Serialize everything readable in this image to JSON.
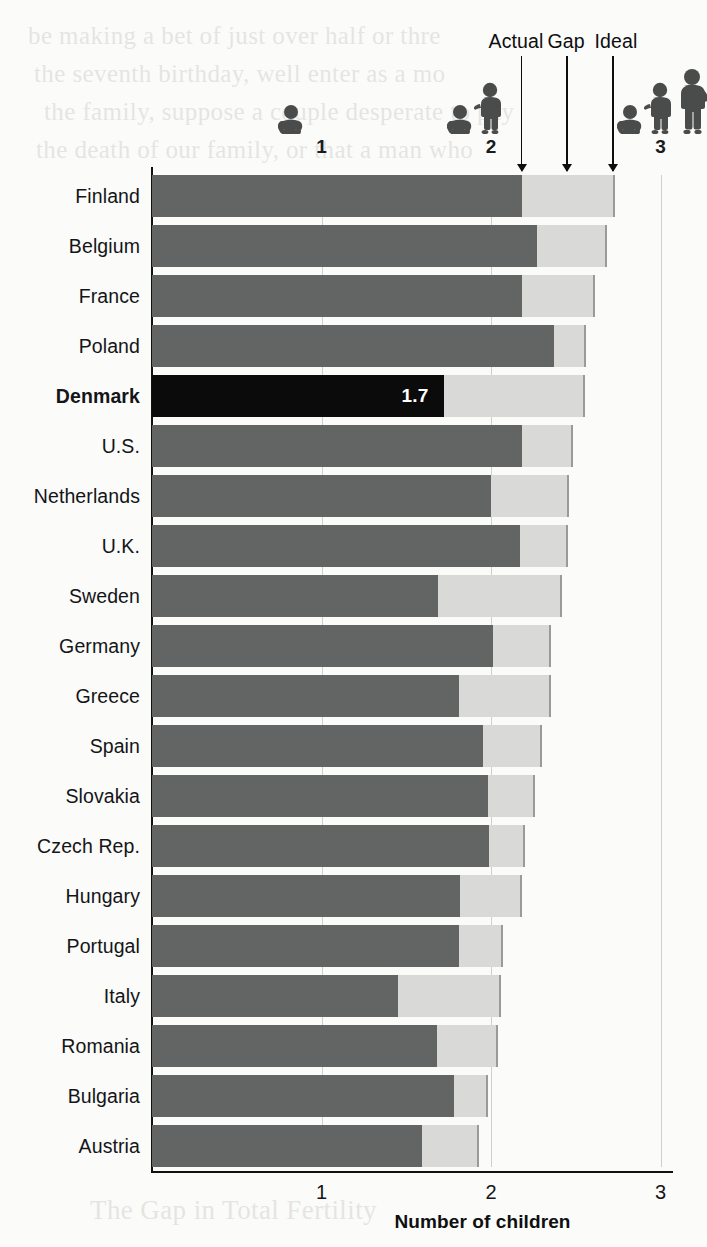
{
  "background_bleed": {
    "lines": [
      "be making a bet of just over half or thre",
      "the seventh birthday, well enter as a mo",
      "the family, suppose a couple desperate to pay",
      "the death of our family, or that a man who"
    ],
    "bottom_line": "The Gap in Total Fertility"
  },
  "legend": {
    "actual": "Actual",
    "gap": "Gap",
    "ideal": "Ideal",
    "pointer_values": {
      "actual": 2.18,
      "gap": 2.45,
      "ideal": 2.72
    }
  },
  "scale_icons": [
    {
      "tick": "1",
      "value": 1,
      "figures": [
        "baby"
      ]
    },
    {
      "tick": "2",
      "value": 2,
      "figures": [
        "baby",
        "child"
      ]
    },
    {
      "tick": "3",
      "value": 3,
      "figures": [
        "baby",
        "child",
        "teen"
      ]
    }
  ],
  "colors": {
    "actual_bar": "#636565",
    "gap_bar": "#d9d9d7",
    "highlight_bar": "#0b0b0b",
    "axis": "#111111",
    "grid": "#cfcfcb",
    "page": "#fbfbf9",
    "value_label_text": "#ffffff"
  },
  "chart_data": {
    "type": "bar",
    "title": "",
    "subtype": "stacked-horizontal",
    "xlabel": "Number of children",
    "ylabel": "",
    "xlim": [
      0,
      3
    ],
    "xticks": [
      1,
      2,
      3
    ],
    "xticklabels": [
      "1",
      "2",
      "3"
    ],
    "grid": true,
    "legend": [
      "Actual",
      "Gap",
      "Ideal"
    ],
    "legend_position": "top",
    "highlight": {
      "category": "Denmark",
      "label": "1.7"
    },
    "categories": [
      "Finland",
      "Belgium",
      "France",
      "Poland",
      "Denmark",
      "U.S.",
      "Netherlands",
      "U.K.",
      "Sweden",
      "Germany",
      "Greece",
      "Spain",
      "Slovakia",
      "Czech Rep.",
      "Hungary",
      "Portugal",
      "Italy",
      "Romania",
      "Bulgaria",
      "Austria"
    ],
    "series": [
      {
        "name": "Actual",
        "values": [
          2.18,
          2.27,
          2.18,
          2.37,
          1.72,
          2.18,
          2.0,
          2.17,
          1.69,
          2.01,
          1.81,
          1.95,
          1.98,
          1.99,
          1.82,
          1.81,
          1.45,
          1.68,
          1.78,
          1.59
        ]
      },
      {
        "name": "Ideal",
        "values": [
          2.72,
          2.67,
          2.6,
          2.55,
          2.54,
          2.47,
          2.45,
          2.44,
          2.41,
          2.34,
          2.34,
          2.29,
          2.25,
          2.19,
          2.17,
          2.06,
          2.05,
          2.03,
          1.97,
          1.92
        ]
      }
    ],
    "rows": [
      {
        "category": "Finland",
        "actual": 2.18,
        "ideal": 2.72,
        "gap": 0.54,
        "bold": false
      },
      {
        "category": "Belgium",
        "actual": 2.27,
        "ideal": 2.67,
        "gap": 0.4,
        "bold": false
      },
      {
        "category": "France",
        "actual": 2.18,
        "ideal": 2.6,
        "gap": 0.42,
        "bold": false
      },
      {
        "category": "Poland",
        "actual": 2.37,
        "ideal": 2.55,
        "gap": 0.18,
        "bold": false
      },
      {
        "category": "Denmark",
        "actual": 1.72,
        "ideal": 2.54,
        "gap": 0.82,
        "bold": true,
        "label": "1.7"
      },
      {
        "category": "U.S.",
        "actual": 2.18,
        "ideal": 2.47,
        "gap": 0.29,
        "bold": false
      },
      {
        "category": "Netherlands",
        "actual": 2.0,
        "ideal": 2.45,
        "gap": 0.45,
        "bold": false
      },
      {
        "category": "U.K.",
        "actual": 2.17,
        "ideal": 2.44,
        "gap": 0.27,
        "bold": false
      },
      {
        "category": "Sweden",
        "actual": 1.69,
        "ideal": 2.41,
        "gap": 0.72,
        "bold": false
      },
      {
        "category": "Germany",
        "actual": 2.01,
        "ideal": 2.34,
        "gap": 0.33,
        "bold": false
      },
      {
        "category": "Greece",
        "actual": 1.81,
        "ideal": 2.34,
        "gap": 0.53,
        "bold": false
      },
      {
        "category": "Spain",
        "actual": 1.95,
        "ideal": 2.29,
        "gap": 0.34,
        "bold": false
      },
      {
        "category": "Slovakia",
        "actual": 1.98,
        "ideal": 2.25,
        "gap": 0.27,
        "bold": false
      },
      {
        "category": "Czech Rep.",
        "actual": 1.99,
        "ideal": 2.19,
        "gap": 0.2,
        "bold": false
      },
      {
        "category": "Hungary",
        "actual": 1.82,
        "ideal": 2.17,
        "gap": 0.35,
        "bold": false
      },
      {
        "category": "Portugal",
        "actual": 1.81,
        "ideal": 2.06,
        "gap": 0.25,
        "bold": false
      },
      {
        "category": "Italy",
        "actual": 1.45,
        "ideal": 2.05,
        "gap": 0.6,
        "bold": false
      },
      {
        "category": "Romania",
        "actual": 1.68,
        "ideal": 2.03,
        "gap": 0.35,
        "bold": false
      },
      {
        "category": "Bulgaria",
        "actual": 1.78,
        "ideal": 1.97,
        "gap": 0.19,
        "bold": false
      },
      {
        "category": "Austria",
        "actual": 1.59,
        "ideal": 1.92,
        "gap": 0.33,
        "bold": false
      }
    ]
  }
}
